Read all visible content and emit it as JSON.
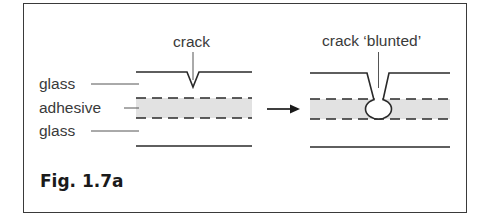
{
  "figure": {
    "caption": "Fig. 1.7a"
  },
  "left_diagram": {
    "labels": {
      "top": "glass",
      "middle": "adhesive",
      "bottom": "glass"
    },
    "crack_label": "crack"
  },
  "right_diagram": {
    "crack_label": "crack ‘blunted’"
  },
  "colors": {
    "line": "#2a2a2a",
    "adhesive_fill": "#e2e2e2",
    "text": "#3a3a3a"
  }
}
